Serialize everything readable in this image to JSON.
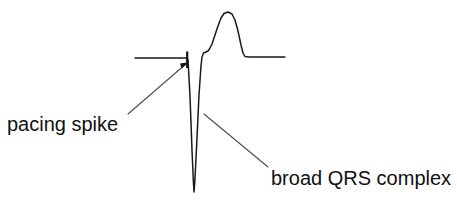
{
  "figure": {
    "width": 457,
    "height": 207,
    "background_color": "#ffffff",
    "trace_color": "#1a1a1a",
    "leader_color": "#4a4a4a",
    "text_color": "#111111"
  },
  "annotations": {
    "pacing_spike": {
      "label": "pacing spike",
      "text_x": 7,
      "text_y": 114,
      "leader_from_x": 128,
      "leader_from_y": 114,
      "leader_to_x": 187,
      "leader_to_y": 63
    },
    "broad_qrs": {
      "label": "broad QRS complex",
      "text_x": 271,
      "text_y": 168,
      "leader_from_x": 204,
      "leader_from_y": 114,
      "leader_to_x": 268,
      "leader_to_y": 167
    }
  },
  "chart_data": {
    "type": "line",
    "title": "",
    "subtitle": "",
    "xlabel": "",
    "ylabel": "",
    "grid": false,
    "legend": "none",
    "axes_visible": false,
    "series": [
      {
        "name": "paced-ecg-beat",
        "color": "#1a1a1a",
        "points": [
          [
            135,
            58
          ],
          [
            183,
            58
          ],
          [
            186,
            58
          ],
          [
            187,
            58
          ],
          [
            188,
            60
          ],
          [
            190,
            96
          ],
          [
            192,
            150
          ],
          [
            193.4,
            182
          ],
          [
            194,
            192
          ],
          [
            194.8,
            182
          ],
          [
            196.5,
            148
          ],
          [
            199,
            95
          ],
          [
            201,
            66
          ],
          [
            202,
            57
          ],
          [
            203.5,
            53
          ],
          [
            206,
            52
          ],
          [
            208,
            51
          ],
          [
            209.5,
            49
          ],
          [
            212,
            44
          ],
          [
            215,
            35
          ],
          [
            218,
            26
          ],
          [
            221,
            18
          ],
          [
            224,
            13.5
          ],
          [
            228,
            12
          ],
          [
            232,
            14
          ],
          [
            235,
            20
          ],
          [
            238,
            31
          ],
          [
            241,
            45
          ],
          [
            243,
            53
          ],
          [
            245,
            56.5
          ],
          [
            249,
            57
          ],
          [
            262,
            57
          ],
          [
            285,
            57
          ]
        ]
      }
    ],
    "features": [
      {
        "name": "left-baseline",
        "kind": "isoelectric-line",
        "x_start": 135,
        "x_end": 187,
        "y": 58
      },
      {
        "name": "pacing-spike",
        "kind": "spike",
        "x": 187,
        "y_top": 51,
        "y_bottom": 68
      },
      {
        "name": "qrs-trough",
        "kind": "negative-deflection",
        "x": 194,
        "y": 192
      },
      {
        "name": "st-notch",
        "kind": "plateau",
        "x_start": 203,
        "x_end": 209,
        "y": 52
      },
      {
        "name": "t-wave-peak",
        "kind": "positive-deflection",
        "x": 228,
        "y": 12
      },
      {
        "name": "right-baseline",
        "kind": "isoelectric-line",
        "x_start": 245,
        "x_end": 285,
        "y": 57
      }
    ],
    "xlim": [
      0,
      457
    ],
    "ylim": [
      207,
      0
    ]
  }
}
